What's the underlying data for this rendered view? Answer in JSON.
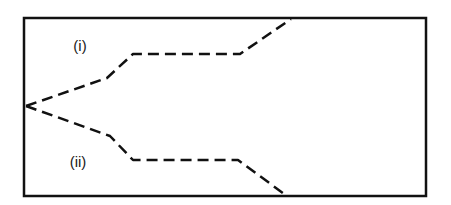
{
  "diagram": {
    "colors": {
      "background": "#ffffff",
      "stroke": "#111111"
    },
    "frame": {
      "x": 24,
      "y": 18,
      "width": 402,
      "height": 178
    },
    "paths": [
      {
        "id": "path-i",
        "label": "(i)",
        "style": "dashed",
        "points": [
          [
            26,
            106
          ],
          [
            107,
            78
          ],
          [
            133,
            54
          ],
          [
            240,
            54
          ],
          [
            291,
            19
          ]
        ]
      },
      {
        "id": "path-ii",
        "label": "(ii)",
        "style": "dashed",
        "points": [
          [
            26,
            106
          ],
          [
            110,
            136
          ],
          [
            133,
            160
          ],
          [
            238,
            160
          ],
          [
            287,
            196
          ]
        ]
      }
    ],
    "labels": [
      {
        "text": "(i)",
        "x": 80,
        "y": 45
      },
      {
        "text": "(ii)",
        "x": 78,
        "y": 161
      }
    ]
  }
}
